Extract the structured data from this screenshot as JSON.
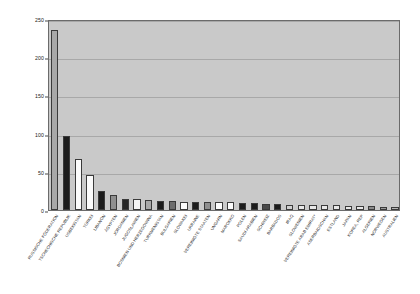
{
  "chart_data": {
    "type": "bar",
    "title": "",
    "subtitle": "",
    "xlabel": "",
    "ylabel": "",
    "ylim": [
      0,
      250
    ],
    "yticks": [
      0,
      50,
      100,
      150,
      200,
      250
    ],
    "grid": true,
    "legend": "none",
    "orientation": "vertical",
    "categories": [
      "RUSSISCHE FÖDERATION",
      "TSCHECHISCHE REPUBLIK",
      "USBEKISTAN",
      "TÜRKEI",
      "LIBANON",
      "ÄGYPTEN",
      "JORDANIEN",
      "JUGOSLAWIEN",
      "BOSNIEN UND HERZEGOWINA",
      "TURKMENISTAN",
      "BULGARIEN",
      "SLOWAKEI",
      "UKRAINE",
      "VEREINIGTE STAATEN",
      "UNGARN",
      "MAROKKO",
      "POLEN",
      "SAUDI ARABIEN",
      "SCHWEIZ",
      "BARBADOS",
      "IRAQ",
      "SLOWENIEN",
      "VEREINIGTE ARAB EMIRAT*",
      "ASERBAIDSCHAN",
      "ESTLAND",
      "JAPAN",
      "KOREA, REP",
      "ALGERIEN",
      "NORWEGEN",
      "AUSTRALIEN"
    ],
    "values": [
      236,
      97,
      67,
      46,
      25,
      19,
      15,
      14,
      13,
      12,
      12,
      11,
      11,
      11,
      10,
      10,
      9,
      9,
      8,
      8,
      7,
      7,
      6,
      6,
      6,
      5,
      5,
      5,
      4,
      4
    ],
    "bar_colors": [
      "#a8a8a8",
      "#1c1c1c",
      "#fbfbfb",
      "#fbfbfb",
      "#1c1c1c",
      "#8f8f8f",
      "#262626",
      "#f5f5f5",
      "#a8a8a8",
      "#1c1c1c",
      "#6e6e6e",
      "#fbfbfb",
      "#1c1c1c",
      "#8f8f8f",
      "#fbfbfb",
      "#fbfbfb",
      "#1c1c1c",
      "#1c1c1c",
      "#4a4a4a",
      "#1c1c1c",
      "#d0d0d0",
      "#e8e8e8",
      "#e8e8e8",
      "#e8e8e8",
      "#e8e8e8",
      "#e8e8e8",
      "#e8e8e8",
      "#8a8a8a",
      "#9a9a9a",
      "#b5b5b5"
    ],
    "plot_background": "#c9c9c9",
    "figure_background": "#ffffff",
    "axis_color": "#6b6b6b",
    "gridline_color": "#a8a8a8"
  }
}
